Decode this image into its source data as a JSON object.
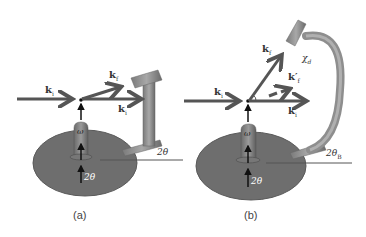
{
  "panels": [
    {
      "id": "a",
      "caption": "(a)",
      "labels": {
        "k_incident": "k",
        "k_incident_sub": "i",
        "k_final": "k",
        "k_final_sub": "f",
        "k_transmitted": "k",
        "k_transmitted_sub": "i",
        "omega": "ω",
        "two_theta_axis": "2θ",
        "two_theta_arm": "2θ"
      }
    },
    {
      "id": "b",
      "caption": "(b)",
      "labels": {
        "k_incident": "k",
        "k_incident_sub": "i",
        "k_final": "k",
        "k_final_sub": "f",
        "k_final_prime": "k′",
        "k_final_prime_sub": "f",
        "k_transmitted": "k",
        "k_transmitted_sub": "i",
        "chi": "χ",
        "chi_sub": "d",
        "omega": "ω",
        "two_theta_axis": "2θ",
        "two_theta_arm": "2θ",
        "two_theta_arm_sub": "B"
      }
    }
  ],
  "colors": {
    "arrow": "#555555",
    "disk": "#6e6e6e",
    "detector": "#8a8a8a",
    "background": "#ffffff"
  }
}
